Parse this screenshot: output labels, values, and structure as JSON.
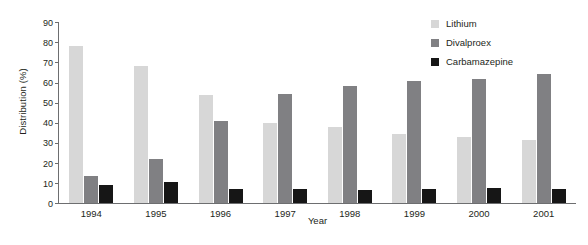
{
  "chart_data": {
    "type": "bar",
    "title": "",
    "xlabel": "Year",
    "ylabel": "Distribution (%)",
    "categories": [
      "1994",
      "1995",
      "1996",
      "1997",
      "1998",
      "1999",
      "2000",
      "2001"
    ],
    "series": [
      {
        "name": "Lithium",
        "color": "#d7d7d7",
        "values": [
          78,
          68,
          53.5,
          40,
          38,
          34.5,
          33,
          31.5
        ]
      },
      {
        "name": "Divalproex",
        "color": "#808083",
        "values": [
          13.5,
          22,
          41,
          54,
          58,
          60.5,
          61.5,
          64
        ]
      },
      {
        "name": "Carbamazepine",
        "color": "#161616",
        "values": [
          9,
          10.5,
          7,
          7,
          6.5,
          7,
          7.5,
          7
        ]
      }
    ],
    "ylim": [
      0,
      90
    ],
    "yticks": [
      0,
      10,
      20,
      30,
      40,
      50,
      60,
      70,
      80,
      90
    ],
    "ytick_labels": [
      "0",
      "10",
      "20",
      "30",
      "40",
      "50",
      "60",
      "70",
      "80",
      "90"
    ],
    "grid": false,
    "legend_position": "top-right"
  }
}
